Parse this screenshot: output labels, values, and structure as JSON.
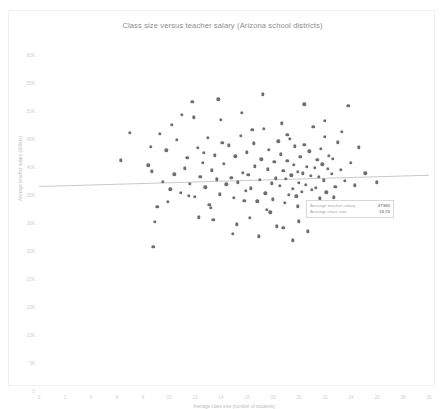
{
  "chart_data": {
    "type": "scatter",
    "title": "Class size versus teacher salary (Arizona school districts)",
    "xlabel": "Average class size (number of students)",
    "ylabel": "Average teacher salary (dollars)",
    "xlim": [
      0,
      30
    ],
    "ylim": [
      0,
      60000
    ],
    "xticks": [
      "0",
      "2",
      "4",
      "6",
      "8",
      "10",
      "12",
      "14",
      "16",
      "18",
      "20",
      "22",
      "24",
      "26",
      "28",
      "30"
    ],
    "xtick_values": [
      0,
      2,
      4,
      6,
      8,
      10,
      12,
      14,
      16,
      18,
      20,
      22,
      24,
      26,
      28,
      30
    ],
    "yticks": [
      "0",
      "5K",
      "10K",
      "15K",
      "20K",
      "25K",
      "30K",
      "35K",
      "40K",
      "45K",
      "50K",
      "55K",
      "60K"
    ],
    "ytick_values": [
      0,
      5000,
      10000,
      15000,
      20000,
      25000,
      30000,
      35000,
      40000,
      45000,
      50000,
      55000,
      60000
    ],
    "grid": false,
    "legend": "none",
    "marker_color": "#6e6e6e",
    "trendline_color": "#c9c9c9",
    "trendline": {
      "x0": 0,
      "y0": 36600,
      "x1": 30,
      "y1": 38600
    },
    "points": [
      [
        6.3,
        41200
      ],
      [
        7.0,
        46100
      ],
      [
        8.4,
        40300
      ],
      [
        8.6,
        43600
      ],
      [
        8.7,
        39200
      ],
      [
        8.9,
        30200
      ],
      [
        9.1,
        32900
      ],
      [
        9.3,
        45900
      ],
      [
        9.5,
        37400
      ],
      [
        9.8,
        43000
      ],
      [
        10.1,
        36000
      ],
      [
        10.4,
        38700
      ],
      [
        10.6,
        44900
      ],
      [
        10.9,
        35400
      ],
      [
        11.0,
        49300
      ],
      [
        11.2,
        39800
      ],
      [
        11.4,
        41600
      ],
      [
        11.6,
        37000
      ],
      [
        11.8,
        51600
      ],
      [
        12.0,
        34700
      ],
      [
        12.2,
        43400
      ],
      [
        12.4,
        38300
      ],
      [
        12.6,
        40800
      ],
      [
        12.8,
        36400
      ],
      [
        13.0,
        45200
      ],
      [
        13.1,
        33200
      ],
      [
        13.3,
        39400
      ],
      [
        13.5,
        42100
      ],
      [
        13.7,
        37800
      ],
      [
        13.9,
        35100
      ],
      [
        14.0,
        48400
      ],
      [
        14.2,
        40600
      ],
      [
        14.4,
        36900
      ],
      [
        14.6,
        43900
      ],
      [
        14.8,
        38100
      ],
      [
        15.0,
        34500
      ],
      [
        15.1,
        41900
      ],
      [
        15.3,
        37300
      ],
      [
        15.5,
        45600
      ],
      [
        15.7,
        39000
      ],
      [
        15.9,
        35800
      ],
      [
        16.0,
        42600
      ],
      [
        16.1,
        38600
      ],
      [
        16.3,
        36200
      ],
      [
        16.5,
        44200
      ],
      [
        16.6,
        40100
      ],
      [
        16.8,
        33900
      ],
      [
        17.0,
        37700
      ],
      [
        17.1,
        41400
      ],
      [
        17.3,
        46800
      ],
      [
        17.4,
        35300
      ],
      [
        17.6,
        39600
      ],
      [
        17.7,
        43100
      ],
      [
        17.9,
        37100
      ],
      [
        18.0,
        34200
      ],
      [
        18.1,
        40900
      ],
      [
        18.2,
        38000
      ],
      [
        18.4,
        44600
      ],
      [
        18.5,
        36600
      ],
      [
        18.6,
        42300
      ],
      [
        18.8,
        39300
      ],
      [
        18.9,
        33600
      ],
      [
        19.0,
        37900
      ],
      [
        19.1,
        41100
      ],
      [
        19.2,
        35000
      ],
      [
        19.3,
        45000
      ],
      [
        19.4,
        38500
      ],
      [
        19.5,
        36100
      ],
      [
        19.6,
        40400
      ],
      [
        19.7,
        43700
      ],
      [
        19.8,
        34800
      ],
      [
        19.9,
        39100
      ],
      [
        20.0,
        37200
      ],
      [
        20.1,
        41800
      ],
      [
        20.2,
        35600
      ],
      [
        20.3,
        38900
      ],
      [
        20.4,
        44000
      ],
      [
        20.5,
        36800
      ],
      [
        20.6,
        40000
      ],
      [
        20.7,
        33100
      ],
      [
        20.8,
        42800
      ],
      [
        20.9,
        38400
      ],
      [
        21.0,
        35900
      ],
      [
        21.1,
        47200
      ],
      [
        21.2,
        39900
      ],
      [
        21.3,
        36300
      ],
      [
        21.4,
        41300
      ],
      [
        21.5,
        38200
      ],
      [
        21.6,
        34400
      ],
      [
        21.7,
        43300
      ],
      [
        21.8,
        40500
      ],
      [
        21.9,
        37600
      ],
      [
        22.0,
        45400
      ],
      [
        22.1,
        35500
      ],
      [
        22.2,
        39700
      ],
      [
        22.3,
        42000
      ],
      [
        22.4,
        33400
      ],
      [
        22.5,
        38800
      ],
      [
        22.6,
        41500
      ],
      [
        22.8,
        36500
      ],
      [
        23.0,
        44400
      ],
      [
        23.2,
        39500
      ],
      [
        23.5,
        37500
      ],
      [
        23.8,
        50900
      ],
      [
        24.0,
        40700
      ],
      [
        24.3,
        36700
      ],
      [
        24.6,
        43500
      ],
      [
        25.1,
        38900
      ],
      [
        26.0,
        37300
      ],
      [
        12.3,
        31000
      ],
      [
        13.4,
        30600
      ],
      [
        15.2,
        29800
      ],
      [
        17.8,
        31900
      ],
      [
        18.3,
        29400
      ],
      [
        20.0,
        30300
      ],
      [
        21.1,
        32100
      ],
      [
        8.8,
        25800
      ],
      [
        14.9,
        28100
      ],
      [
        16.9,
        27600
      ],
      [
        19.5,
        26900
      ],
      [
        10.2,
        47500
      ],
      [
        11.9,
        48900
      ],
      [
        13.8,
        52100
      ],
      [
        15.6,
        49700
      ],
      [
        17.2,
        53000
      ],
      [
        18.7,
        47800
      ],
      [
        20.4,
        51200
      ],
      [
        22.0,
        48200
      ],
      [
        23.3,
        46300
      ],
      [
        14.1,
        44300
      ],
      [
        16.4,
        46600
      ],
      [
        19.1,
        45800
      ],
      [
        12.7,
        42500
      ],
      [
        15.8,
        34000
      ],
      [
        17.5,
        32400
      ],
      [
        19.9,
        33000
      ],
      [
        21.4,
        31500
      ],
      [
        9.9,
        33800
      ],
      [
        11.5,
        34900
      ],
      [
        13.2,
        32700
      ],
      [
        16.2,
        30900
      ],
      [
        18.8,
        29100
      ],
      [
        20.7,
        28500
      ],
      [
        22.7,
        34600
      ]
    ]
  },
  "summary": {
    "rows": [
      {
        "label": "Average teacher salary",
        "value": "37360"
      },
      {
        "label": "Average class size",
        "value": "19.70"
      }
    ]
  }
}
